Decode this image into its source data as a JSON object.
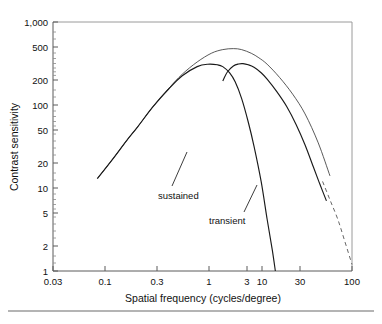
{
  "chart_data": {
    "type": "line",
    "title": "",
    "xlabel": "Spatial frequency (cycles/degree)",
    "ylabel": "Contrast sensitivity",
    "xscale": "log",
    "yscale": "log",
    "xlim": [
      0.03,
      100
    ],
    "ylim": [
      1,
      1000
    ],
    "grid": false,
    "legend_position": "inline-annotation",
    "x_tick_labels": [
      "0.03",
      "0.1",
      "0.3",
      "1",
      "3",
      "10",
      "30",
      "100"
    ],
    "x_tick_values": [
      0.03,
      0.1,
      0.3,
      1,
      3,
      10,
      30,
      100
    ],
    "y_tick_labels": [
      "1,000",
      "500",
      "200",
      "100",
      "50",
      "20",
      "10",
      "5",
      "2",
      "1"
    ],
    "y_tick_values": [
      1000,
      500,
      200,
      100,
      50,
      20,
      10,
      5,
      2,
      1
    ],
    "annotations": [
      {
        "text": "sustained",
        "x": 1.0,
        "y": 9.5
      },
      {
        "text": "transient",
        "x": 3.2,
        "y": 3.6
      }
    ],
    "series": [
      {
        "name": "envelope",
        "style": "solid-thin",
        "x": [
          0.1,
          0.15,
          0.22,
          0.3,
          0.45,
          0.7,
          1.0,
          1.5,
          2.2,
          3.0,
          4.0,
          5.0,
          6.5,
          8.0,
          10,
          14,
          20,
          28,
          40,
          55
        ],
        "y": [
          13,
          22,
          37,
          55,
          95,
          160,
          235,
          330,
          420,
          465,
          478,
          465,
          420,
          370,
          310,
          215,
          135,
          78,
          35,
          14
        ]
      },
      {
        "name": "sustained",
        "style": "solid",
        "x": [
          0.1,
          0.15,
          0.22,
          0.3,
          0.45,
          0.7,
          1.0,
          1.5,
          2.0,
          2.6,
          3.0,
          3.6,
          4.2,
          5.0,
          6.0,
          7.0,
          8.5,
          10.0,
          11.5,
          12.5
        ],
        "y": [
          13,
          22,
          37,
          55,
          95,
          158,
          225,
          290,
          310,
          305,
          290,
          245,
          190,
          120,
          62,
          32,
          12,
          4.2,
          1.8,
          1.0
        ]
      },
      {
        "name": "transient",
        "style": "solid",
        "x": [
          3.0,
          3.4,
          4.0,
          4.6,
          5.2,
          6.0,
          7.0,
          8.5,
          10,
          13,
          17,
          22,
          28,
          35,
          42,
          50
        ],
        "y": [
          195,
          250,
          295,
          312,
          315,
          305,
          285,
          245,
          205,
          145,
          96,
          58,
          33,
          18,
          11,
          7
        ]
      },
      {
        "name": "transient-extrapolated",
        "style": "dashed",
        "x": [
          45,
          55,
          68,
          82,
          100
        ],
        "y": [
          12,
          7.2,
          4.2,
          2.3,
          1.2
        ]
      }
    ]
  },
  "figure": {
    "caption_rule_visible": true
  }
}
